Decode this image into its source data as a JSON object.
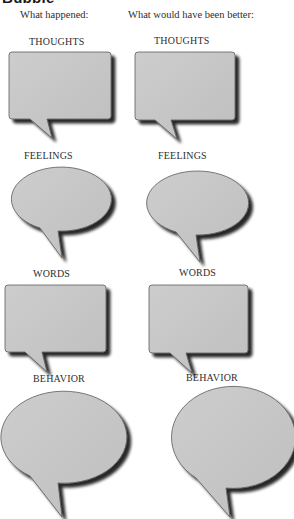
{
  "page": {
    "heading": "Bubble"
  },
  "columns": {
    "left_header": "What happened:",
    "right_header": "What would have been better:"
  },
  "rows": [
    {
      "label": "THOUGHTS",
      "shape": "rectangle"
    },
    {
      "label": "FEELINGS",
      "shape": "ellipse"
    },
    {
      "label": "WORDS",
      "shape": "rectangle"
    },
    {
      "label": "BEHAVIOR",
      "shape": "ellipse"
    }
  ],
  "colors": {
    "bubble_fill": "#c6c6c6",
    "bubble_outline": "#5a5a5a",
    "bubble_shadow": "#3c3c3c",
    "text": "#2e2e2e"
  }
}
